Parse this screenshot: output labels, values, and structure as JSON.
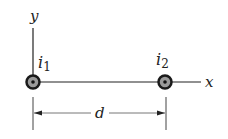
{
  "diagram": {
    "axes": {
      "y_label": "y",
      "x_label": "x"
    },
    "wires": [
      {
        "label": "i",
        "subscript": "1",
        "direction": "out-of-page"
      },
      {
        "label": "i",
        "subscript": "2",
        "direction": "out-of-page"
      }
    ],
    "separation": {
      "label": "d"
    },
    "colors": {
      "line": "#222222",
      "wire_ring": "#1a1a1a",
      "wire_fill": "#9a9a9a",
      "dimension_line": "#555555"
    }
  }
}
